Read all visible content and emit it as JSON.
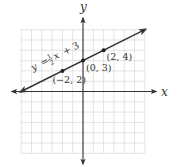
{
  "chart_data": {
    "type": "line",
    "title": "",
    "xlabel": "x",
    "ylabel": "y",
    "xlim": [
      -6,
      6
    ],
    "ylim": [
      -6,
      6
    ],
    "grid": true,
    "grid_step": 1,
    "equation": "y = 1/2 x + 3",
    "equation_parts": {
      "lhs": "y",
      "eq": "=",
      "num": "1",
      "den": "2",
      "var": "x",
      "rest": "+ 3"
    },
    "series": [
      {
        "name": "y = 1/2 x + 3",
        "slope": 0.5,
        "intercept": 3,
        "x": [
          -6,
          6
        ],
        "y": [
          0,
          6
        ],
        "arrows": "both"
      }
    ],
    "points": [
      {
        "x": -2,
        "y": 2,
        "label": "(−2, 2)"
      },
      {
        "x": 0,
        "y": 3,
        "label": "(0, 3)"
      },
      {
        "x": 2,
        "y": 4,
        "label": "(2, 4)"
      }
    ],
    "colors": {
      "grid": "#d9d9d9",
      "axis": "#333333",
      "line": "#333333",
      "point": "#222222"
    }
  }
}
